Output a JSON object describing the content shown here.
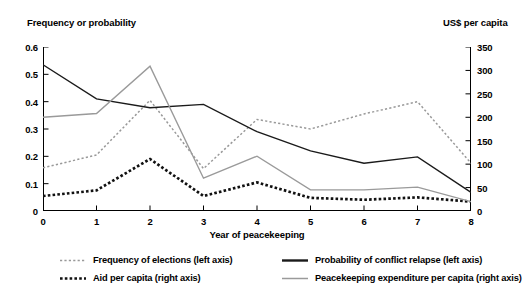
{
  "chart_data": {
    "type": "line",
    "title": "",
    "subtitle": "",
    "xlabel": "Year of peacekeeping",
    "left_axis_title": "Frequency or probability",
    "right_axis_title": "US$ per capita",
    "x": [
      0,
      1,
      2,
      3,
      4,
      5,
      6,
      7,
      8
    ],
    "xlim": [
      0,
      8
    ],
    "xticks": [
      "0",
      "1",
      "2",
      "3",
      "4",
      "5",
      "6",
      "7",
      "8"
    ],
    "ylim_left": [
      0,
      0.6
    ],
    "yticks_left": [
      "0",
      "0.1",
      "0.2",
      "0.3",
      "0.4",
      "0.5",
      "0.6"
    ],
    "ylim_right": [
      0,
      350
    ],
    "yticks_right": [
      "0",
      "50",
      "100",
      "150",
      "200",
      "250",
      "300",
      "350"
    ],
    "grid": false,
    "legend_position": "below",
    "series": [
      {
        "name": "Frequency of elections  (left axis)",
        "axis": "left",
        "style": "dotted",
        "color": "#999999",
        "values": [
          0.158,
          0.205,
          0.405,
          0.155,
          0.335,
          0.3,
          0.355,
          0.4,
          0.175
        ]
      },
      {
        "name": "Probability of conflict relapse  (left axis)",
        "axis": "left",
        "style": "solid",
        "color": "#1a1a1a",
        "values": [
          0.535,
          0.41,
          0.378,
          0.39,
          0.29,
          0.22,
          0.175,
          0.198,
          0.068
        ]
      },
      {
        "name": "Aid per capita  (right axis)",
        "axis": "right",
        "style": "dotted-thick",
        "color": "#111111",
        "values": [
          32,
          44,
          111,
          32,
          61,
          28,
          24,
          29,
          20
        ]
      },
      {
        "name": "Peacekeeping expenditure per capita (right axis)",
        "axis": "right",
        "style": "solid",
        "color": "#9a9a9a",
        "values": [
          200,
          208,
          309,
          70,
          117,
          45,
          45,
          51,
          20
        ]
      }
    ]
  },
  "left_axis": {
    "title": "Frequency or probability",
    "ticks": [
      "0.6",
      "0.5",
      "0.4",
      "0.3",
      "0.2",
      "0.1",
      "0"
    ]
  },
  "right_axis": {
    "title": "US$ per capita",
    "ticks": [
      "350",
      "300",
      "250",
      "200",
      "150",
      "100",
      "50",
      "0"
    ]
  },
  "x_axis": {
    "label": "Year of peacekeeping",
    "ticks": [
      "0",
      "1",
      "2",
      "3",
      "4",
      "5",
      "6",
      "7",
      "8"
    ]
  },
  "legend": {
    "items": [
      {
        "label": "Frequency of elections (left axis)",
        "swatch": "dotted-gray-line-icon"
      },
      {
        "label": "Probability of conflict relapse  (left axis)",
        "swatch": "solid-black-line-icon"
      },
      {
        "label": "Aid per capita  (right axis)",
        "swatch": "dotted-black-line-icon"
      },
      {
        "label": "Peacekeeping expenditure per capita (right axis)",
        "swatch": "solid-gray-line-icon"
      }
    ]
  }
}
